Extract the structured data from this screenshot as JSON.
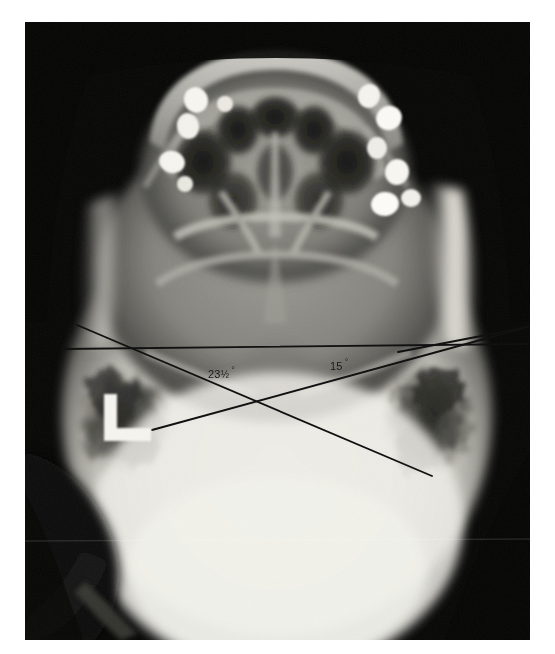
{
  "image": {
    "kind": "radiograph",
    "modality": "X-ray",
    "view": "submentovertex skull (base) view",
    "background_color": "#ffffff",
    "film_color": "#070707",
    "width": 555,
    "height": 654
  },
  "film": {
    "left": 25,
    "top": 22,
    "width": 505,
    "height": 618
  },
  "annotations": {
    "line_color": "#111111",
    "angles": [
      {
        "id": "angle-23",
        "label": "23",
        "fraction": "½",
        "unit": "°",
        "value": 23.5,
        "x": 208,
        "y": 365
      },
      {
        "id": "angle-15",
        "label": "15",
        "fraction": "",
        "unit": "°",
        "value": 15,
        "x": 330,
        "y": 357
      }
    ],
    "lines": [
      {
        "name": "horizontal-reference-line",
        "x1": 62,
        "y1": 349,
        "x2": 528,
        "y2": 344
      },
      {
        "name": "descending-angle-line",
        "x1": 77,
        "y1": 325,
        "x2": 432,
        "y2": 476
      },
      {
        "name": "ascending-angle-line",
        "x1": 152,
        "y1": 430,
        "x2": 528,
        "y2": 327
      },
      {
        "name": "upper-right-short-line",
        "x1": 398,
        "y1": 352,
        "x2": 528,
        "y2": 327
      }
    ],
    "markers": [
      {
        "name": "left-side-L-marker",
        "glyph": "L",
        "x": 96,
        "y": 400,
        "color": "#f2f2ee"
      }
    ]
  },
  "anatomy": {
    "regions": [
      {
        "name": "maxillary-dental-arch",
        "description": "dental arch with radiopaque amalgam restorations"
      },
      {
        "name": "nasal-cavity-and-sinuses",
        "description": "dark air-filled paranasal sinus spaces"
      },
      {
        "name": "zygomatic-arch-right",
        "description": "bright lateral bony ridge"
      },
      {
        "name": "zygomatic-arch-left",
        "description": "bright lateral bony ridge"
      },
      {
        "name": "mastoid-air-cells-left",
        "description": "mottled dark petromastoid region"
      },
      {
        "name": "mastoid-air-cells-right",
        "description": "mottled dark petromastoid region"
      },
      {
        "name": "cranial-vault",
        "description": "bright dense occipital cranial vault"
      },
      {
        "name": "skull-base",
        "description": "mid-grey central skull base"
      }
    ],
    "amalgam_fillings_count": 9
  }
}
